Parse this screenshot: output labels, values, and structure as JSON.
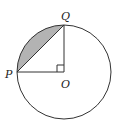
{
  "diagram": {
    "type": "circle-sector-segment",
    "center": {
      "label": "O",
      "x": 64,
      "y": 72
    },
    "radius": 47,
    "points": [
      {
        "label": "P",
        "x": 17,
        "y": 72
      },
      {
        "label": "Q",
        "x": 64,
        "y": 25
      }
    ],
    "right_angle_at": "O",
    "shaded_region": "minor segment between chord PQ and arc PQ",
    "colors": {
      "stroke": "#333333",
      "shade": "#b3b3b3",
      "background": "#ffffff"
    }
  },
  "labels": {
    "P": "P",
    "Q": "Q",
    "O": "O"
  }
}
